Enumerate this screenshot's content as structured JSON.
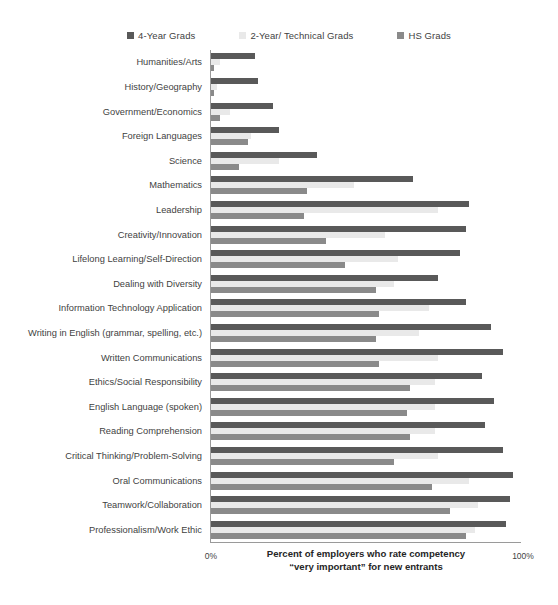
{
  "chart_data": {
    "type": "bar",
    "orientation": "horizontal",
    "grouped": true,
    "title": "",
    "xlabel_lines": [
      "Percent of employers who rate competency",
      "“very important” for new entrants"
    ],
    "ylabel": "",
    "xlim": [
      0,
      100
    ],
    "xticks": [
      0,
      100
    ],
    "xtick_labels": [
      "0%",
      "100%"
    ],
    "grid": false,
    "legend_position": "top",
    "categories": [
      "Humanities/Arts",
      "History/Geography",
      "Government/Economics",
      "Foreign Languages",
      "Science",
      "Mathematics",
      "Leadership",
      "Creativity/Innovation",
      "Lifelong Learning/Self-Direction",
      "Dealing with Diversity",
      "Information Technology Application",
      "Writing in English (grammar, spelling, etc.)",
      "Written Communications",
      "Ethics/Social Responsibility",
      "English Language (spoken)",
      "Reading Comprehension",
      "Critical Thinking/Problem-Solving",
      "Oral Communications",
      "Teamwork/Collaboration",
      "Professionalism/Work Ethic"
    ],
    "series": [
      {
        "name": "4-Year Grads",
        "color": "#595959",
        "values": [
          14,
          15,
          20,
          22,
          34,
          65,
          83,
          82,
          80,
          73,
          82,
          90,
          94,
          87,
          91,
          88,
          94,
          97,
          96,
          95
        ]
      },
      {
        "name": "2-Year/ Technical Grads",
        "color": "#e9e9e9",
        "values": [
          3,
          2,
          6,
          13,
          22,
          46,
          73,
          56,
          60,
          59,
          70,
          67,
          73,
          72,
          72,
          72,
          73,
          83,
          86,
          85
        ]
      },
      {
        "name": "HS Grads",
        "color": "#8a8a8a",
        "values": [
          1,
          1,
          3,
          12,
          9,
          31,
          30,
          37,
          43,
          53,
          54,
          53,
          54,
          64,
          63,
          64,
          59,
          71,
          77,
          82
        ]
      }
    ]
  },
  "legend": {
    "entries": [
      {
        "label": "4-Year Grads",
        "color": "#595959"
      },
      {
        "label": "2-Year/ Technical Grads",
        "color": "#e9e9e9"
      },
      {
        "label": "HS Grads",
        "color": "#8a8a8a"
      }
    ]
  },
  "axis": {
    "min_label": "0%",
    "max_label": "100%",
    "title_line1": "Percent of employers who rate competency",
    "title_line2": "“very important” for new entrants"
  }
}
